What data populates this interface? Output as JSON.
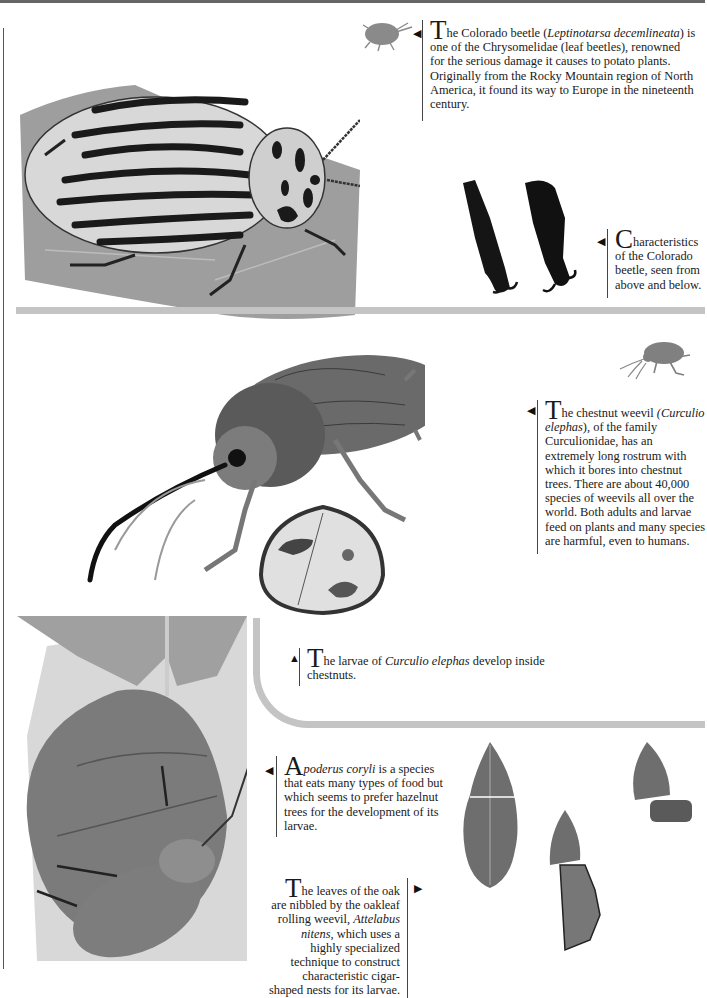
{
  "page": {
    "type": "scanned encyclopedia page",
    "palette": {
      "ink": "#1a1a1a",
      "rule": "#555555",
      "separator": "#c4c4c4",
      "leaf": "#8f8f8f",
      "beetle_dark": "#222222"
    }
  },
  "captions": {
    "colorado_beetle": {
      "dropcap": "T",
      "text_before": "he Colorado beetle (",
      "italic": "Leptinotarsa decemlineata",
      "text_after": ") is one of the Chrysomelidae (leaf beetles), renowned for the serious damage it causes to potato plants. Originally from the Rocky Mountain region of North America, it found its way to Europe in the nineteenth century."
    },
    "characteristics": {
      "dropcap": "C",
      "text": "haracteristics of the Colorado beetle, seen from above and below."
    },
    "chestnut_weevil": {
      "dropcap": "T",
      "text_before": "he chestnut weevil ",
      "italic": "(Curculio elephas",
      "text_after": "), of the family Curculionidae, has an extremely long rostrum with which it bores into chestnut trees. There are about 40,000 species of weevils all over the world. Both adults and larvae feed on plants and many species are harmful, even to humans."
    },
    "larvae": {
      "dropcap": "T",
      "text_before": "he larvae of ",
      "italic": "Curculio elephas",
      "text_after": " develop inside chestnuts."
    },
    "apoderus": {
      "dropcap": "A",
      "italic": "poderus coryli",
      "text_after": " is a species that eats many types of food but which seems to prefer hazelnut trees for the development of its larvae."
    },
    "oak_leaves": {
      "dropcap": "T",
      "text_before": "he leaves of the oak are nibbled by the oakleaf rolling weevil, ",
      "italic": "Attelabus nitens",
      "text_after": ", which uses a highly specialized technique to construct characteristic cigar-shaped nests for its larvae."
    }
  },
  "pointers": {
    "left": "◀",
    "up": "▲",
    "right": "▶"
  },
  "illustrations": [
    {
      "id": "colorado-beetle-silhouette",
      "label": "Colorado beetle silhouette"
    },
    {
      "id": "colorado-beetle-on-leaf",
      "label": "Colorado beetle on potato leaf"
    },
    {
      "id": "beetle-legs",
      "label": "Colorado beetle legs, above and below"
    },
    {
      "id": "weevil-silhouette",
      "label": "Chestnut weevil silhouette"
    },
    {
      "id": "chestnut-weevil",
      "label": "Chestnut weevil"
    },
    {
      "id": "chestnut-cross-section",
      "label": "Chestnut with larva"
    },
    {
      "id": "apoderus-on-leaf",
      "label": "Apoderus coryli on rolled hazel leaf"
    },
    {
      "id": "oak-leaves",
      "label": "Oak leaves cut and rolled"
    }
  ]
}
